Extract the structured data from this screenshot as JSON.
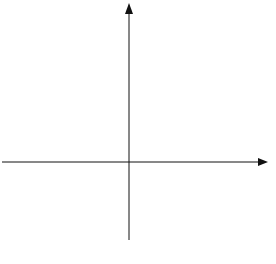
{
  "figure": {
    "caption": "FIGURE 1.1",
    "x_label": "x",
    "y_label": "y"
  },
  "diagram": {
    "type": "family of parabolas y = x^2 + C",
    "curves": [
      {
        "name": "C = 2",
        "offset": 2
      },
      {
        "name": "C = 1",
        "offset": 1
      },
      {
        "name": "C = 0",
        "offset": 0
      },
      {
        "name": "C = -1",
        "offset": -1
      },
      {
        "name": "C = -2",
        "offset": -2
      }
    ]
  }
}
